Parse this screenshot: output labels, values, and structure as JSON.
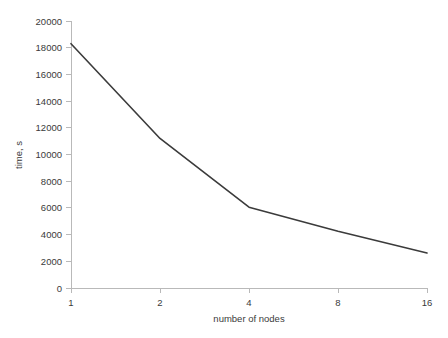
{
  "chart_data": {
    "type": "line",
    "title": "",
    "xlabel": "number of nodes",
    "ylabel": "time, s",
    "grid": false,
    "legend": false,
    "x_tick_labels": [
      "1",
      "2",
      "4",
      "8",
      "16"
    ],
    "x_scale": "log2-categorical",
    "x_values": [
      1,
      2,
      4,
      8,
      16
    ],
    "y_tick_labels": [
      "0",
      "2000",
      "4000",
      "6000",
      "8000",
      "10000",
      "12000",
      "14000",
      "16000",
      "18000",
      "20000"
    ],
    "y_ticks": [
      0,
      2000,
      4000,
      6000,
      8000,
      10000,
      12000,
      14000,
      16000,
      18000,
      20000
    ],
    "ylim": [
      0,
      20000
    ],
    "series": [
      {
        "name": "time",
        "values": [
          18300,
          11200,
          6050,
          4250,
          2620
        ]
      }
    ],
    "line_color": "#3b3b3b",
    "axis_color": "#b9b9b9",
    "text_color": "#3a3a3a",
    "background_color": "#ffffff"
  }
}
